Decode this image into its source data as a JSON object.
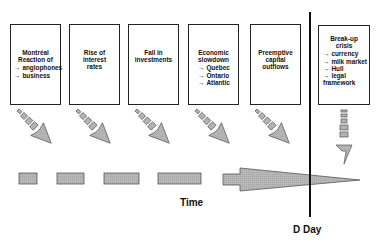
{
  "diagram": {
    "boxes": [
      {
        "id": "montreal",
        "title": [
          "Montréal",
          "Reaction of"
        ],
        "items": [
          "anglophones",
          "business"
        ]
      },
      {
        "id": "rates",
        "title": [
          "Rise of",
          "interest",
          "rates"
        ],
        "items": []
      },
      {
        "id": "investments",
        "title": [
          "Fall in",
          "investments"
        ],
        "items": []
      },
      {
        "id": "slowdown",
        "title": [
          "Economic",
          "slowdown"
        ],
        "items": [
          "Québec",
          "Ontario",
          "Atlantic"
        ]
      },
      {
        "id": "outflows",
        "title": [
          "Preemptive",
          "capital",
          "outflows"
        ],
        "items": []
      },
      {
        "id": "breakup",
        "title": [
          "Break-up",
          "crisis"
        ],
        "items": [
          "currency",
          "milk market",
          "Hull",
          "legal framework"
        ]
      }
    ],
    "item_prefix": "→",
    "time_label": "Time",
    "dday_label": "D Day",
    "colors": {
      "fill": "#b4b4b4",
      "stroke": "#555555",
      "line": "#111111"
    }
  }
}
